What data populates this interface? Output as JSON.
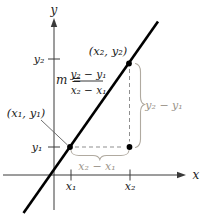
{
  "figure": {
    "bg": "#ffffff",
    "colors": {
      "axis": "#3a3a3a",
      "main_line": "#000000",
      "text": "#222222",
      "dashed": "#8f8f8f",
      "brace": "#b0aaa0",
      "measure_label": "#9b958b"
    },
    "axis_labels": {
      "x": "x",
      "y": "y"
    },
    "tick_labels": {
      "x1": "x₁",
      "x2": "x₂",
      "y1": "y₁",
      "y2": "y₂"
    },
    "point_labels": {
      "p1": "(x₁, y₁)",
      "p2": "(x₂, y₂)"
    },
    "formula": {
      "lhs": "m =",
      "numerator": "y₂ − y₁",
      "denominator": "x₂ − x₁"
    },
    "measure_labels": {
      "rise": "y₂ − y₁",
      "run": "x₂ − x₁"
    }
  }
}
